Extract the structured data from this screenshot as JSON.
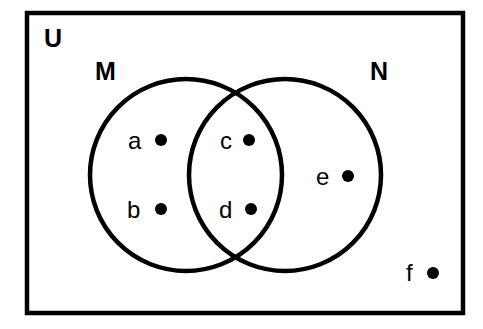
{
  "diagram": {
    "type": "venn",
    "background_color": "#ffffff",
    "stroke_color": "#000000",
    "universe": {
      "label": "U",
      "label_x": 44,
      "label_y": 47,
      "rect": {
        "x": 27,
        "y": 13,
        "width": 436,
        "height": 300
      }
    },
    "sets": [
      {
        "id": "M",
        "label": "M",
        "label_x": 95,
        "label_y": 80,
        "cx": 186,
        "cy": 175,
        "r": 96
      },
      {
        "id": "N",
        "label": "N",
        "label_x": 370,
        "label_y": 80,
        "cx": 285,
        "cy": 175,
        "r": 96
      }
    ],
    "elements": [
      {
        "label": "a",
        "region": "M-only",
        "label_x": 128,
        "label_y": 149,
        "dot_x": 161,
        "dot_y": 140,
        "dot_r": 6
      },
      {
        "label": "b",
        "region": "M-only",
        "label_x": 127,
        "label_y": 218,
        "dot_x": 161,
        "dot_y": 209,
        "dot_r": 6
      },
      {
        "label": "c",
        "region": "M-and-N",
        "label_x": 220,
        "label_y": 149,
        "dot_x": 249,
        "dot_y": 140,
        "dot_r": 6
      },
      {
        "label": "d",
        "region": "M-and-N",
        "label_x": 219,
        "label_y": 218,
        "dot_x": 251,
        "dot_y": 209,
        "dot_r": 6
      },
      {
        "label": "e",
        "region": "N-only",
        "label_x": 316,
        "label_y": 185,
        "dot_x": 348,
        "dot_y": 176,
        "dot_r": 6
      },
      {
        "label": "f",
        "region": "outside-both",
        "label_x": 406,
        "label_y": 281,
        "dot_x": 433,
        "dot_y": 273,
        "dot_r": 6
      }
    ]
  }
}
